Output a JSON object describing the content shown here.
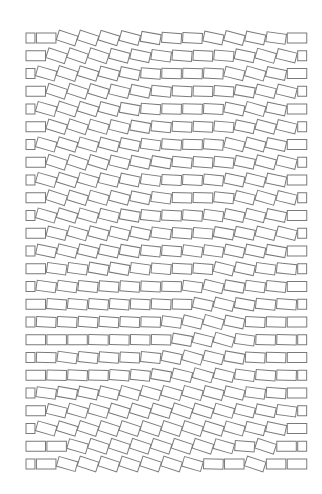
{
  "artwork": {
    "background": "#ffffff",
    "stroke_color": "#7a7a7a",
    "origin_x": 26,
    "origin_y": 33,
    "row_pitch": 17.75,
    "brick_pitch": 20.9,
    "brick_width": 19.5,
    "brick_height": 10,
    "rows_count": 25,
    "slots_per_row": 14,
    "rotations": [
      [
        0,
        0,
        18,
        18,
        17,
        15,
        10,
        4,
        3,
        12,
        15,
        12,
        8,
        0
      ],
      [
        0,
        18,
        19,
        18,
        15,
        12,
        8,
        4,
        3,
        5,
        12,
        16,
        14,
        0
      ],
      [
        0,
        16,
        18,
        17,
        15,
        12,
        4,
        1,
        2,
        3,
        14,
        16,
        12,
        0
      ],
      [
        0,
        18,
        18,
        17,
        14,
        12,
        6,
        3,
        2,
        4,
        10,
        14,
        14,
        0
      ],
      [
        0,
        16,
        18,
        17,
        15,
        10,
        4,
        2,
        2,
        3,
        12,
        16,
        12,
        0
      ],
      [
        0,
        17,
        18,
        16,
        14,
        10,
        6,
        3,
        3,
        5,
        12,
        15,
        14,
        0
      ],
      [
        0,
        16,
        17,
        16,
        15,
        12,
        8,
        4,
        2,
        4,
        14,
        15,
        12,
        0
      ],
      [
        0,
        18,
        18,
        17,
        14,
        12,
        10,
        6,
        4,
        6,
        12,
        15,
        14,
        0
      ],
      [
        0,
        16,
        17,
        16,
        14,
        12,
        8,
        3,
        3,
        6,
        12,
        14,
        12,
        0
      ],
      [
        0,
        18,
        17,
        16,
        15,
        12,
        8,
        2,
        2,
        6,
        14,
        16,
        14,
        0
      ],
      [
        0,
        16,
        17,
        16,
        14,
        10,
        6,
        3,
        4,
        8,
        12,
        14,
        12,
        0
      ],
      [
        0,
        14,
        16,
        15,
        14,
        12,
        8,
        4,
        5,
        10,
        12,
        14,
        14,
        0
      ],
      [
        0,
        12,
        14,
        13,
        12,
        10,
        6,
        4,
        8,
        8,
        12,
        12,
        10,
        0
      ],
      [
        0,
        8,
        8,
        10,
        10,
        8,
        5,
        3,
        4,
        14,
        12,
        8,
        6,
        0
      ],
      [
        0,
        8,
        8,
        6,
        4,
        4,
        3,
        2,
        8,
        14,
        10,
        8,
        6,
        0
      ],
      [
        0,
        4,
        5,
        4,
        4,
        3,
        3,
        2,
        12,
        14,
        10,
        6,
        4,
        0
      ],
      [
        0,
        3,
        3,
        4,
        4,
        3,
        2,
        8,
        14,
        16,
        12,
        3,
        2,
        0
      ],
      [
        0,
        0,
        0,
        1,
        1,
        1,
        2,
        10,
        14,
        16,
        8,
        2,
        1,
        0
      ],
      [
        0,
        2,
        8,
        6,
        4,
        3,
        6,
        12,
        16,
        14,
        10,
        3,
        2,
        0
      ],
      [
        0,
        2,
        3,
        2,
        4,
        6,
        10,
        14,
        16,
        14,
        8,
        4,
        2,
        0
      ],
      [
        0,
        8,
        10,
        12,
        14,
        16,
        16,
        16,
        16,
        15,
        14,
        8,
        4,
        0
      ],
      [
        0,
        14,
        16,
        16,
        17,
        17,
        17,
        18,
        17,
        16,
        14,
        12,
        8,
        0
      ],
      [
        0,
        16,
        17,
        18,
        18,
        18,
        18,
        18,
        18,
        17,
        16,
        14,
        12,
        0
      ],
      [
        0,
        0,
        16,
        18,
        18,
        18,
        18,
        18,
        18,
        16,
        4,
        18,
        0,
        0
      ],
      [
        0,
        0,
        16,
        18,
        18,
        18,
        18,
        18,
        16,
        2,
        0,
        18,
        0,
        0
      ]
    ]
  }
}
